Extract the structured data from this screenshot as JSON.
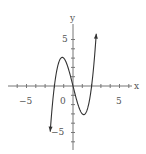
{
  "chart_data": {
    "type": "line",
    "title": "",
    "xlabel": "x",
    "ylabel": "y",
    "xlim": [
      -7,
      7.5
    ],
    "ylim": [
      -8,
      8
    ],
    "grid": false,
    "legend": null,
    "x_ticks": [
      -6,
      -5,
      -4,
      -3,
      -2,
      -1,
      1,
      2,
      3,
      4,
      5,
      6
    ],
    "y_ticks": [
      -6,
      -5,
      -4,
      -3,
      -2,
      -1,
      1,
      2,
      3,
      4,
      5
    ],
    "tick_labels": {
      "x_neg": "−5",
      "origin": "0",
      "x_pos": "5",
      "y_pos": "5",
      "y_neg": "−5"
    },
    "series": [
      {
        "name": "y = x^3 - 4x",
        "function": "x^3 - 4x",
        "domain": [
          -2.45,
          2.5
        ],
        "arrows": "both",
        "points": [
          [
            -2.45,
            -4.9
          ],
          [
            -2.0,
            0.0
          ],
          [
            -1.5,
            2.6
          ],
          [
            -1.15,
            3.08
          ],
          [
            -1.0,
            3.0
          ],
          [
            -0.5,
            1.9
          ],
          [
            0.0,
            0.0
          ],
          [
            0.5,
            -1.9
          ],
          [
            1.0,
            -3.0
          ],
          [
            1.15,
            -3.08
          ],
          [
            1.5,
            -2.6
          ],
          [
            2.0,
            0.0
          ],
          [
            2.5,
            5.6
          ]
        ]
      }
    ],
    "annotations": [
      {
        "text": "local max",
        "x": -1.15,
        "y": 3.08
      },
      {
        "text": "local min",
        "x": 1.15,
        "y": -3.08
      }
    ]
  },
  "labels": {
    "x_axis": "x",
    "y_axis": "y",
    "x_neg": "−5",
    "origin": "0",
    "x_pos": "5",
    "y_pos": "5",
    "y_neg": "−5"
  },
  "colors": {
    "axis": "#777777",
    "curve": "#333333",
    "text": "#555555"
  }
}
